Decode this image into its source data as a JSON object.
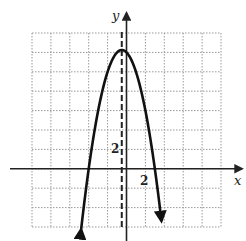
{
  "chart_data": {
    "type": "line",
    "title": "",
    "xlabel": "x",
    "ylabel": "y",
    "function": "y = -x^2 - x + 12",
    "grid": true,
    "grid_unit": 2,
    "xlim": [
      -10,
      10
    ],
    "ylim": [
      -6,
      14
    ],
    "tick_labels": {
      "x": [
        "2"
      ],
      "y": [
        "2"
      ]
    },
    "axis_of_symmetry": {
      "x": -0.5,
      "style": "dashed"
    },
    "vertex": [
      -0.5,
      12.25
    ],
    "x_intercepts": [
      -4,
      3
    ],
    "y_intercept": 12,
    "series": [
      {
        "name": "parabola",
        "x": [
          -4.8,
          -4,
          -3,
          -2,
          -1,
          -0.5,
          0,
          1,
          2,
          3,
          3.7
        ],
        "values": [
          -6.24,
          0,
          6,
          10,
          12,
          12.25,
          12,
          10,
          6,
          0,
          -5.39
        ]
      }
    ],
    "colors": {
      "curve": "#111111",
      "grid": "#9a9a9a",
      "axes": "#222222"
    }
  }
}
